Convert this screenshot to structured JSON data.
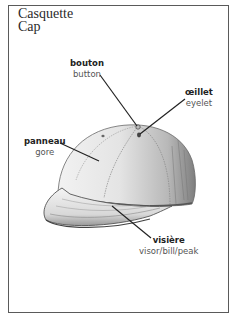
{
  "title": {
    "french": "Casquette",
    "english": "Cap"
  },
  "labels": [
    {
      "id": "button",
      "french": "bouton",
      "english": "button"
    },
    {
      "id": "eyelet",
      "french": "œillet",
      "english": "eyelet"
    },
    {
      "id": "gore",
      "french": "panneau",
      "english": "gore"
    },
    {
      "id": "visor",
      "french": "visière",
      "english": "visor/bill/peak"
    }
  ],
  "colors": {
    "frame": "#5a5a5a",
    "ink": "#222222",
    "cap_light": "#e8e8e8",
    "cap_shadow": "#8a8a8a"
  }
}
